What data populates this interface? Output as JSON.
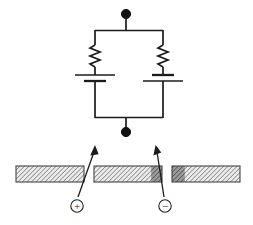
{
  "figure": {
    "background_color": "#ffffff",
    "line_color": "#1b1b1b",
    "width": 253,
    "height": 225
  },
  "circuit": {
    "terminals": [
      {
        "name": "top-terminal",
        "label": "",
        "cx": 126,
        "cy": 14,
        "r": 4.6,
        "color": "#111111"
      },
      {
        "name": "bottom-terminal",
        "label": "",
        "cx": 126,
        "cy": 132,
        "r": 4.6,
        "color": "#111111"
      }
    ],
    "top_lead": {
      "x": 126,
      "y1": 18,
      "y2": 30
    },
    "bottom_lead": {
      "x": 126,
      "y1": 118,
      "y2": 128
    },
    "top_rail": {
      "x1": 95,
      "x2": 163,
      "y": 30
    },
    "bottom_rail": {
      "x1": 95,
      "x2": 163,
      "y": 118
    },
    "branches": [
      {
        "name": "left-branch",
        "x": 95,
        "wire_top_y": 30,
        "wire_bottom_y": 118,
        "resistor": {
          "name": "resistor-left",
          "label": "",
          "x": 95,
          "y_top": 44,
          "y_bottom": 66,
          "zig_amplitude": 5,
          "zig_count": 6
        },
        "battery": {
          "name": "battery-left",
          "label": "",
          "long_plate": {
            "y": 75,
            "half_width": 20,
            "thickness": 1.4
          },
          "short_plate": {
            "y": 81,
            "half_width": 11,
            "thickness": 2.2
          },
          "polarity": "positive-up"
        }
      },
      {
        "name": "right-branch",
        "x": 163,
        "wire_top_y": 30,
        "wire_bottom_y": 118,
        "resistor": {
          "name": "resistor-right",
          "label": "",
          "x": 163,
          "y_top": 44,
          "y_bottom": 66,
          "zig_amplitude": 5,
          "zig_count": 6
        },
        "battery": {
          "name": "battery-right",
          "label": "",
          "long_plate": {
            "y": 81,
            "half_width": 20,
            "thickness": 1.4
          },
          "short_plate": {
            "y": 75,
            "half_width": 11,
            "thickness": 2.2
          },
          "polarity": "negative-up"
        }
      }
    ]
  },
  "bars": {
    "hatch": {
      "angle_deg": 45,
      "spacing": 3.2,
      "light_fill": "#e9e9e9",
      "dark_fill": "#9a9a9a",
      "line_color": "#555555",
      "outline_color": "#444444"
    },
    "items": [
      {
        "name": "bar-left",
        "label": "",
        "x": 16,
        "y": 166,
        "width": 68,
        "height": 16,
        "segments": [
          {
            "name": "segment-light",
            "start": 0.0,
            "end": 1.0,
            "shade": "light"
          }
        ]
      },
      {
        "name": "bar-middle",
        "label": "",
        "x": 94,
        "y": 166,
        "width": 68,
        "height": 16,
        "segments": [
          {
            "name": "segment-light",
            "start": 0.0,
            "end": 0.84,
            "shade": "light"
          },
          {
            "name": "segment-dark",
            "start": 0.84,
            "end": 1.0,
            "shade": "dark"
          }
        ]
      },
      {
        "name": "bar-right",
        "label": "",
        "x": 172,
        "y": 166,
        "width": 68,
        "height": 16,
        "segments": [
          {
            "name": "segment-dark",
            "start": 0.0,
            "end": 0.19,
            "shade": "dark"
          },
          {
            "name": "segment-light",
            "start": 0.19,
            "end": 1.0,
            "shade": "light"
          }
        ]
      }
    ]
  },
  "annotations": {
    "arrows": [
      {
        "name": "arrow-positive",
        "label": "",
        "x1": 78,
        "y1": 197,
        "x2": 95,
        "y2": 147,
        "head_size": 7,
        "color": "#1b1b1b"
      },
      {
        "name": "arrow-negative",
        "label": "",
        "x1": 164,
        "y1": 197,
        "x2": 156,
        "y2": 147,
        "head_size": 7,
        "color": "#1b1b1b"
      }
    ],
    "symbols": [
      {
        "name": "plus-charge-symbol",
        "glyph": "+",
        "aria": "circled-plus",
        "cx": 77,
        "cy": 206,
        "r": 6.2,
        "font_size": 11,
        "color": "#222222"
      },
      {
        "name": "minus-charge-symbol",
        "glyph": "−",
        "aria": "circled-minus",
        "cx": 165,
        "cy": 206,
        "r": 6.2,
        "font_size": 11,
        "color": "#222222"
      }
    ]
  }
}
